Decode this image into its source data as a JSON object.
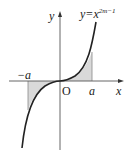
{
  "figure": {
    "labels": {
      "y_axis": "y",
      "x_axis": "x",
      "origin": "O",
      "neg_a": "−a",
      "pos_a": "a",
      "function_lhs": "y=x",
      "function_exponent": "2m−1"
    },
    "colors": {
      "curve": "#222222",
      "axis": "#555555",
      "shade": "#d9d9d9"
    }
  }
}
